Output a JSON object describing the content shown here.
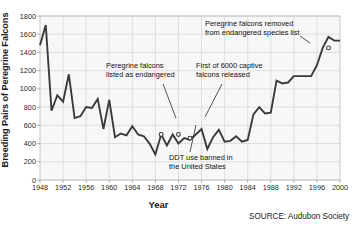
{
  "chart_data": {
    "type": "line",
    "title": "",
    "xlabel": "Year",
    "ylabel": "Breeding Pairs of Peregrine Falcons",
    "xlim": [
      1948,
      2000
    ],
    "ylim": [
      0,
      1800
    ],
    "ytick_step": 200,
    "xtick_step": 4,
    "grid": true,
    "legend": null,
    "source": "SOURCE: Audubon Society",
    "line_color": "#3b3b3b",
    "grid_color": "#d8d8d8",
    "plot_bg": "#f7f7f7",
    "ytick_labels": [
      "0",
      "200",
      "400",
      "600",
      "800",
      "1000",
      "1200",
      "1400",
      "1600",
      "1800"
    ],
    "xtick_labels": [
      "1948",
      "1952",
      "1956",
      "1960",
      "1964",
      "1968",
      "1972",
      "1976",
      "1980",
      "1984",
      "1988",
      "1992",
      "1996",
      "2000"
    ],
    "x": [
      1948,
      1949,
      1950,
      1951,
      1952,
      1953,
      1954,
      1955,
      1956,
      1957,
      1958,
      1959,
      1960,
      1961,
      1962,
      1963,
      1964,
      1965,
      1966,
      1967,
      1968,
      1969,
      1970,
      1971,
      1972,
      1973,
      1974,
      1975,
      1976,
      1977,
      1978,
      1979,
      1980,
      1981,
      1982,
      1983,
      1984,
      1985,
      1986,
      1987,
      1988,
      1989,
      1990,
      1991,
      1992,
      1993,
      1994,
      1995,
      1996,
      1997,
      1998,
      1999,
      2000
    ],
    "y": [
      1480,
      1700,
      760,
      930,
      860,
      1160,
      680,
      700,
      800,
      790,
      890,
      560,
      880,
      470,
      510,
      490,
      590,
      500,
      480,
      400,
      280,
      500,
      380,
      500,
      400,
      460,
      440,
      500,
      560,
      340,
      470,
      550,
      420,
      430,
      480,
      420,
      440,
      720,
      800,
      730,
      740,
      1090,
      1060,
      1070,
      1140,
      1140,
      1140,
      1140,
      1260,
      1450,
      1570,
      1530,
      1530
    ],
    "markers": [
      {
        "x": 1969,
        "y": 500,
        "label": "peregrine-falcons-listed-as-endangered"
      },
      {
        "x": 1972,
        "y": 500,
        "label": "ddt-use-banned"
      },
      {
        "x": 1974,
        "y": 460,
        "label": "first-captive-falcons-released"
      },
      {
        "x": 1998,
        "y": 1450,
        "label": "peregrine-falcons-removed-from-list"
      }
    ],
    "annotations": [
      {
        "id": "listed-as-endangered",
        "lines": [
          "Peregrine falcons",
          "listed as endangered"
        ]
      },
      {
        "id": "captive-released",
        "lines": [
          "First of 6000 captive",
          "falcons released"
        ]
      },
      {
        "id": "removed-from-list",
        "lines": [
          "Peregrine falcons removed",
          "from endangered species list"
        ]
      },
      {
        "id": "ddt-banned",
        "lines": [
          "DDT use banned in",
          "the United States"
        ]
      }
    ]
  }
}
